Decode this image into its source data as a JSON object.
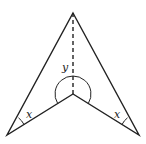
{
  "diagram": {
    "vertices": {
      "top": [
        73,
        13
      ],
      "inner": [
        73,
        94
      ],
      "bottom_left": [
        7,
        135
      ],
      "bottom_right": [
        139,
        135
      ]
    },
    "labels": {
      "reflex_angle": "y",
      "left_angle": "x",
      "right_angle": "x"
    },
    "colors": {
      "stroke": "#222222",
      "background": "#ffffff"
    }
  }
}
